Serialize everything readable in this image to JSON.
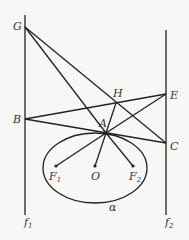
{
  "diagram": {
    "type": "geometry",
    "points": {
      "G": {
        "label": "G",
        "x": 25,
        "y": 27
      },
      "B": {
        "label": "B",
        "x": 25,
        "y": 119
      },
      "H": {
        "label": "H",
        "x": 116,
        "y": 103
      },
      "E": {
        "label": "E",
        "x": 166,
        "y": 94
      },
      "A": {
        "label": "A",
        "x": 106,
        "y": 133
      },
      "C": {
        "label": "C",
        "x": 166,
        "y": 143
      },
      "F1": {
        "label": "F",
        "sub": "1",
        "x": 56,
        "y": 166
      },
      "O": {
        "label": "O",
        "x": 95,
        "y": 166
      },
      "F2": {
        "label": "F",
        "sub": "2",
        "x": 133,
        "y": 166
      }
    },
    "lines": {
      "f1": {
        "label": "f",
        "sub": "1"
      },
      "f2": {
        "label": "f",
        "sub": "2"
      }
    },
    "ellipse": {
      "label": "α"
    }
  }
}
